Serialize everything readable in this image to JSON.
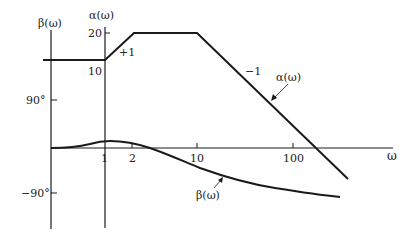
{
  "diagram": {
    "type": "bode-plot-sketch",
    "axes": {
      "phase_axis_label": "β(ω)",
      "magnitude_axis_label": "α(ω)",
      "frequency_axis_label": "ω",
      "magnitude_ticks": [
        "20",
        "10"
      ],
      "phase_ticks": [
        "90°",
        "−90°"
      ],
      "frequency_ticks": [
        "1",
        "2",
        "10",
        "100"
      ]
    },
    "annotations": {
      "slope_rise": "+1",
      "slope_fall": "−1",
      "alpha_curve_label": "α(ω)",
      "beta_curve_label": "β(ω)"
    },
    "colors": {
      "line": "#1a1a1a",
      "text": "#222222",
      "background": "#ffffff"
    }
  }
}
